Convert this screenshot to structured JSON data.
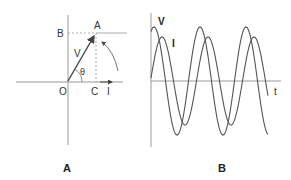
{
  "panel_a": {
    "caption": "A",
    "labels": {
      "point_a": "A",
      "point_b": "B",
      "origin": "O",
      "point_c": "C",
      "vector": "V",
      "angle": "θ",
      "current_axis": "I"
    }
  },
  "panel_b": {
    "caption": "B",
    "labels": {
      "voltage": "V",
      "current": "I",
      "time_axis": "t"
    },
    "waves": [
      {
        "name": "V",
        "amplitude_px": 54,
        "period_px": 46,
        "first_peak_x": 154
      },
      {
        "name": "I",
        "amplitude_px": 44,
        "period_px": 46,
        "first_peak_x": 162
      }
    ]
  },
  "colors": {
    "line": "#555555",
    "axis": "#888888",
    "dashed": "#999999",
    "text": "#333333"
  }
}
